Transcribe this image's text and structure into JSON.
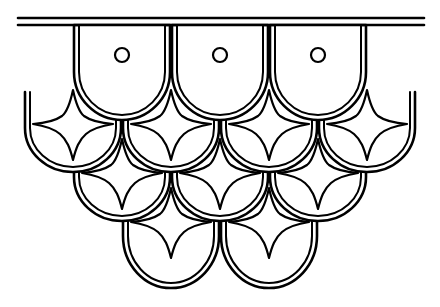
{
  "artwork": {
    "title": "Scalloped Scale Ornament",
    "description": "Black outline line-art of an overlapping scallop (fish-scale) drapery pattern with four-pointed star motifs and small circles, hanging from a double horizontal rail.",
    "canvas": {
      "width": 440,
      "height": 307
    },
    "colors": {
      "background": "#ffffff",
      "stroke": "#000000",
      "fill": "#ffffff"
    },
    "stroke": {
      "outer_width": 2.6,
      "inner_width": 2.0,
      "motif_width": 2.2,
      "bar_width": 2.6,
      "inner_offset": 5
    },
    "rail": {
      "name": "double-horizontal-rail",
      "x1": 18,
      "x2": 424,
      "y_top": 18,
      "y_bottom": 25
    },
    "geometry": {
      "scale_half_width": 48,
      "scale_top_y_by_row": [
        25,
        92,
        141,
        190
      ],
      "scale_bottom_y_by_row": [
        120,
        170,
        219,
        288
      ],
      "row_pitch": 49
    },
    "rows": [
      {
        "index": 1,
        "name": "row-one",
        "motif": "circle",
        "top": 25,
        "bottom": 120,
        "centers": [
          122,
          220,
          318
        ],
        "half_centers": [],
        "circle_radius": 7,
        "circle_cy": 55
      },
      {
        "index": 2,
        "name": "row-two",
        "motif": "star",
        "top": 92,
        "bottom": 170,
        "centers": [
          73,
          171,
          269,
          367
        ],
        "clip_left": 22,
        "clip_right": 418,
        "star_cy": 118
      },
      {
        "index": 3,
        "name": "row-three",
        "motif": "star",
        "top": 141,
        "bottom": 219,
        "centers": [
          122,
          220,
          318
        ],
        "star_cy": 167
      },
      {
        "index": 4,
        "name": "row-four",
        "motif": "star",
        "top": 190,
        "bottom": 288,
        "centers": [
          171,
          269
        ],
        "star_cy": 216
      }
    ],
    "star": {
      "name": "four-pointed-star",
      "half_width": 40,
      "top_reach": 28,
      "bottom_reach": 40,
      "waist": 7,
      "count_total": 9
    },
    "counts": {
      "rows": 4,
      "scales_total": 12,
      "circles": 3,
      "stars": 9,
      "rail_lines": 2
    }
  }
}
